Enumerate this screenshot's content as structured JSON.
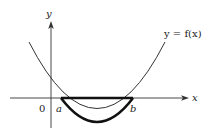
{
  "diagram": {
    "type": "function-graph",
    "axes": {
      "x_label": "x",
      "y_label": "y",
      "origin_label": "0"
    },
    "curve": {
      "label": "y = f(x)",
      "shape": "upward parabola",
      "roots": [
        "a",
        "b"
      ]
    },
    "points": {
      "a_label": "a",
      "b_label": "b"
    },
    "highlight": {
      "description": "Bold segment [a,b] on x-axis and bold arc of curve below x-axis between a and b"
    },
    "colors": {
      "line": "#222222",
      "background": "#ffffff"
    }
  }
}
